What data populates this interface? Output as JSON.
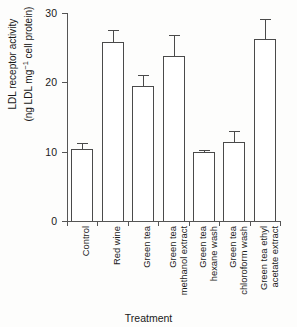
{
  "chart_data": {
    "type": "bar",
    "title": "",
    "xlabel": "Treatment",
    "ylabel_line1": "LDL receptor activity",
    "ylabel_line2_pre": "(ng LDL mg",
    "ylabel_line2_sup": "−1",
    "ylabel_line2_post": " cell protein)",
    "ylim": [
      0,
      30
    ],
    "yticks": [
      0,
      10,
      20,
      30
    ],
    "ytick_labels": [
      "0",
      "10",
      "20",
      "30"
    ],
    "grid": false,
    "legend": "none",
    "errorbars": "yes",
    "categories": [
      "Control",
      "Red wine",
      "Green tea",
      "Green tea methanol extract",
      "Green tea hexane wash",
      "Green tea chloroform wash",
      "Green tea ethyl acetate extract"
    ],
    "category_lines": [
      [
        "Control"
      ],
      [
        "Red wine"
      ],
      [
        "Green tea"
      ],
      [
        "Green tea",
        "methanol extract"
      ],
      [
        "Green tea",
        "hexane wash"
      ],
      [
        "Green tea",
        "chloroform wash"
      ],
      [
        "Green tea ethyl",
        "acetate extract"
      ]
    ],
    "values": [
      10.4,
      25.8,
      19.5,
      23.8,
      10.0,
      11.4,
      26.2
    ],
    "errors": [
      0.9,
      1.8,
      1.5,
      3.1,
      0.3,
      1.6,
      3.0
    ],
    "bar_color": "#ffffff",
    "bar_edge_color": "#4a4a4a",
    "axis_color": "#555555",
    "text_color": "#1a1a1a"
  }
}
